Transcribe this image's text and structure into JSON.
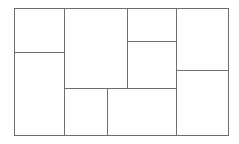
{
  "diagram": {
    "type": "rectangle-partition",
    "background": "#ffffff",
    "stroke_color": "#6e6e6e",
    "cells": [
      {
        "id": "left-top",
        "x": 14.5,
        "y": 8.5,
        "w": 50,
        "h": 44
      },
      {
        "id": "left-bottom",
        "x": 14.5,
        "y": 52.5,
        "w": 50,
        "h": 83
      },
      {
        "id": "center-top",
        "x": 64.5,
        "y": 8.5,
        "w": 63,
        "h": 80
      },
      {
        "id": "mid-right-top",
        "x": 127.5,
        "y": 8.5,
        "w": 49,
        "h": 33
      },
      {
        "id": "mid-right-mid",
        "x": 127.5,
        "y": 41.5,
        "w": 49,
        "h": 47
      },
      {
        "id": "bottom-left-sm",
        "x": 64.5,
        "y": 88.5,
        "w": 43,
        "h": 47
      },
      {
        "id": "bottom-center",
        "x": 107.5,
        "y": 88.5,
        "w": 69,
        "h": 47
      },
      {
        "id": "right-top",
        "x": 176.5,
        "y": 8.5,
        "w": 52,
        "h": 62
      },
      {
        "id": "right-bottom",
        "x": 176.5,
        "y": 70.5,
        "w": 52,
        "h": 65
      }
    ]
  }
}
